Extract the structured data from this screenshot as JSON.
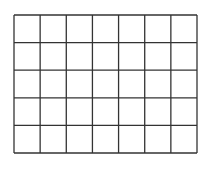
{
  "grid": {
    "columns": 7,
    "rows": 5,
    "x0": 14,
    "y0": 15,
    "x1": 197,
    "y1": 153,
    "line_color": "#333333",
    "line_width": 1.3,
    "fill": "#ffffff"
  }
}
